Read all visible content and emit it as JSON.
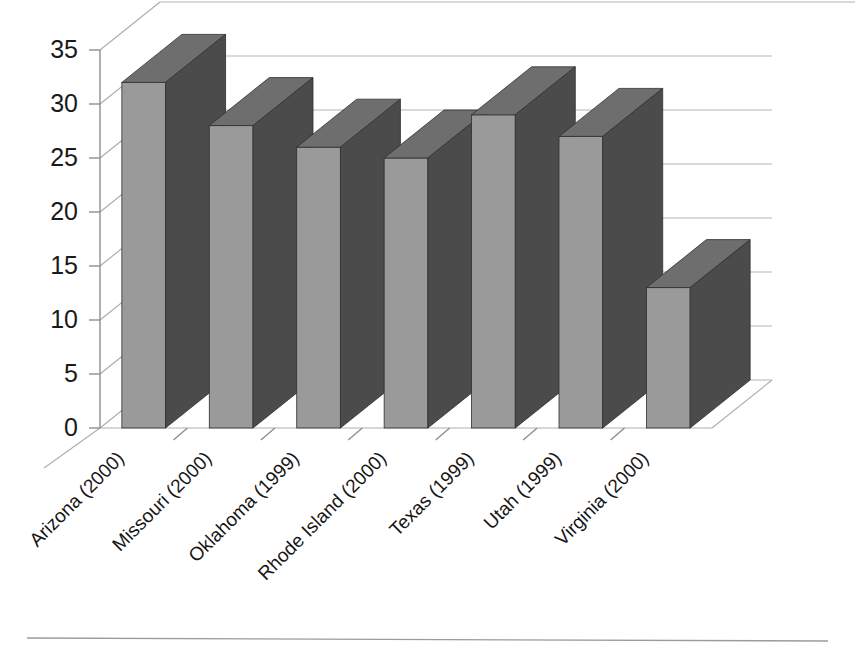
{
  "chart_data": {
    "type": "bar",
    "title": "",
    "subtitle": "",
    "xlabel": "",
    "ylabel": "",
    "categories": [
      "Arizona (2000)",
      "Missouri (2000)",
      "Oklahoma (1999)",
      "Rhode Island (2000)",
      "Texas (1999)",
      "Utah (1999)",
      "Virginia (2000)"
    ],
    "values": [
      32,
      28,
      26,
      25,
      29,
      27,
      13
    ],
    "ylim": [
      0,
      35
    ],
    "ytick_step": 5,
    "yticks": [
      "0",
      "5",
      "10",
      "15",
      "20",
      "25",
      "30",
      "35"
    ],
    "grid": true,
    "legend": "none",
    "style": "3d-column",
    "annotations": []
  },
  "colors": {
    "bar_front": "#9a9a9a",
    "bar_side": "#4b4b4b",
    "bar_top": "#6e6e6e",
    "bar_outline": "#2f2f2f",
    "gridline": "#b4b4b4",
    "axis": "#8e8e8e",
    "text": "#161616",
    "background": "#ffffff"
  },
  "footer": {
    "rule_visible": "true"
  }
}
